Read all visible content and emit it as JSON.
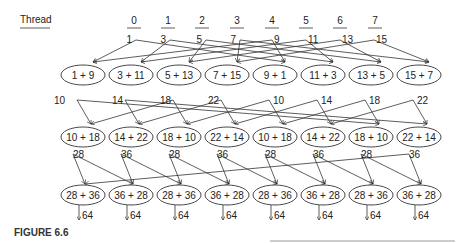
{
  "thread_label": "Thread",
  "threads": [
    "0",
    "1",
    "2",
    "3",
    "4",
    "5",
    "6",
    "7"
  ],
  "initial_values": [
    "1",
    "3",
    "5",
    "7",
    "9",
    "11",
    "13",
    "15"
  ],
  "step1": {
    "ops": [
      "1 + 9",
      "3 + 11",
      "5 + 13",
      "7 + 15",
      "9 + 1",
      "11 + 3",
      "13 + 5",
      "15 + 7"
    ],
    "results": [
      "10",
      "14",
      "18",
      "22",
      "10",
      "14",
      "18",
      "22"
    ]
  },
  "step2": {
    "ops": [
      "10 + 18",
      "14 + 22",
      "18 + 10",
      "22 + 14",
      "10 + 18",
      "14 + 22",
      "18 + 10",
      "22 + 14"
    ],
    "results": [
      "28",
      "36",
      "28",
      "36",
      "28",
      "36",
      "28",
      "36"
    ]
  },
  "step3": {
    "ops": [
      "28 + 36",
      "36 + 28",
      "28 + 36",
      "36 + 28",
      "28 + 36",
      "36 + 28",
      "28 + 36",
      "36 + 28"
    ],
    "results": [
      "64",
      "64",
      "64",
      "64",
      "64",
      "64",
      "64",
      "64"
    ]
  },
  "caption": "FIGURE 6.6"
}
